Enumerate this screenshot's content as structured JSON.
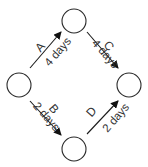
{
  "diagram": {
    "type": "activity-on-arrow network",
    "nodes": [
      {
        "id": "start",
        "cx": 19,
        "cy": 85
      },
      {
        "id": "top",
        "cx": 74,
        "cy": 21
      },
      {
        "id": "bottom",
        "cx": 74,
        "cy": 149
      },
      {
        "id": "end",
        "cx": 129,
        "cy": 85
      }
    ],
    "edges": [
      {
        "label": "A",
        "duration": "4 days",
        "from": "start",
        "to": "top"
      },
      {
        "label": "B",
        "duration": "2 days",
        "from": "start",
        "to": "bottom"
      },
      {
        "label": "C",
        "duration": "4 days",
        "from": "top",
        "to": "end"
      },
      {
        "label": "D",
        "duration": "2 days",
        "from": "bottom",
        "to": "end"
      }
    ]
  }
}
